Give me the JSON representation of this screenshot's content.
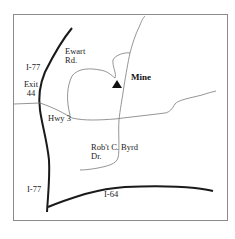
{
  "map": {
    "colors": {
      "frame": "#8a8a8a",
      "highway": "#1a1a1a",
      "road": "#7a7a7a",
      "marker": "#111111"
    },
    "labels": {
      "ewart_line1": "Ewart",
      "ewart_line2": "Rd.",
      "i77_top": "I-77",
      "exit_line1": "Exit",
      "exit_line2": "44",
      "hwy3": "Hwy 3",
      "mine": "Mine",
      "byrd_line1": "Rob't C. Byrd",
      "byrd_line2": "Dr.",
      "i77_bottom": "I-77",
      "i64": "I-64"
    },
    "markers": [
      {
        "name": "mine",
        "icon": "triangle-icon"
      }
    ],
    "roads": [
      "I-77",
      "I-64",
      "Hwy 3",
      "Ewart Rd.",
      "Rob't C. Byrd Dr."
    ]
  }
}
